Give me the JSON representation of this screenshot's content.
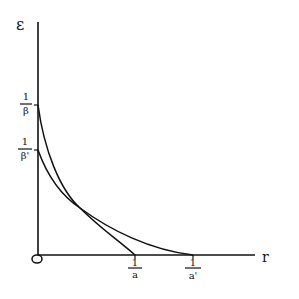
{
  "diagram": {
    "y_axis_label": "ε",
    "x_axis_label": "r",
    "origin_label": "O",
    "y_ticks": [
      {
        "num": "1",
        "den": "β",
        "y": 105
      },
      {
        "num": "1",
        "den": "β'",
        "y": 150
      }
    ],
    "x_ticks": [
      {
        "num": "1",
        "den": "a",
        "x": 135
      },
      {
        "num": "1",
        "den": "a'",
        "x": 193
      }
    ],
    "curves": [
      {
        "name": "curve-beta-a",
        "from": "1/β",
        "to": "1/a"
      },
      {
        "name": "curve-betaprime-aprime",
        "from": "1/β'",
        "to": "1/a'"
      }
    ],
    "colors": {
      "ink": "#111111",
      "background": "#ffffff"
    }
  }
}
